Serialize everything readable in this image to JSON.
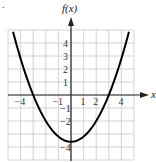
{
  "chart_data": {
    "type": "line",
    "title": "",
    "xlabel": "x",
    "ylabel": "f(x)",
    "xlim": [
      -5,
      5
    ],
    "ylim": [
      -5,
      5
    ],
    "grid": true,
    "x_tick_labels": [
      "−4",
      "−1",
      "1",
      "2",
      "4"
    ],
    "x_tick_values": [
      -4,
      -1,
      1,
      2,
      4
    ],
    "y_tick_labels": [
      "4",
      "3",
      "2",
      "1",
      "−1",
      "−2",
      "−4"
    ],
    "y_tick_values": [
      4,
      3,
      2,
      1,
      -1,
      -2,
      -4
    ],
    "series": [
      {
        "name": "f(x)",
        "description": "upward-opening parabola, vertex near (0, -3.6), x-intercepts near -3 and 3",
        "x": [
          -4.6,
          -4,
          -3,
          -2,
          -1,
          0,
          1,
          2,
          3,
          4,
          4.6
        ],
        "y": [
          4.9,
          2.8,
          0,
          -2.0,
          -3.2,
          -3.6,
          -3.2,
          -2.0,
          0,
          2.8,
          4.9
        ]
      }
    ],
    "colors": {
      "grid": "#c8c8c8",
      "axis": "#222222",
      "curve": "#000000"
    }
  },
  "labels": {
    "y_axis": "f(x)",
    "x_axis": "x",
    "corner_mark": "."
  }
}
